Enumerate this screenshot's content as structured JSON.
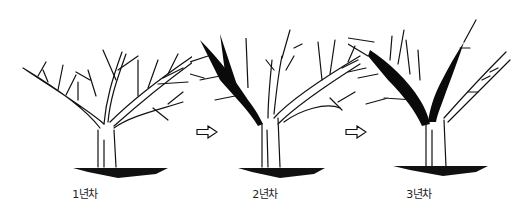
{
  "diagram": {
    "type": "pruning-sequence",
    "stages": [
      {
        "label": "1년차",
        "pruned_branches": "none"
      },
      {
        "label": "2년차",
        "pruned_branches": "left leader (blackened)"
      },
      {
        "label": "3년차",
        "pruned_branches": "two central leaders (blackened)"
      }
    ],
    "arrows": [
      {
        "from": "1년차",
        "to": "2년차"
      },
      {
        "from": "2년차",
        "to": "3년차"
      }
    ],
    "colors": {
      "line": "#111111",
      "pruned_fill": "#0a0a0a",
      "background": "#ffffff"
    }
  }
}
